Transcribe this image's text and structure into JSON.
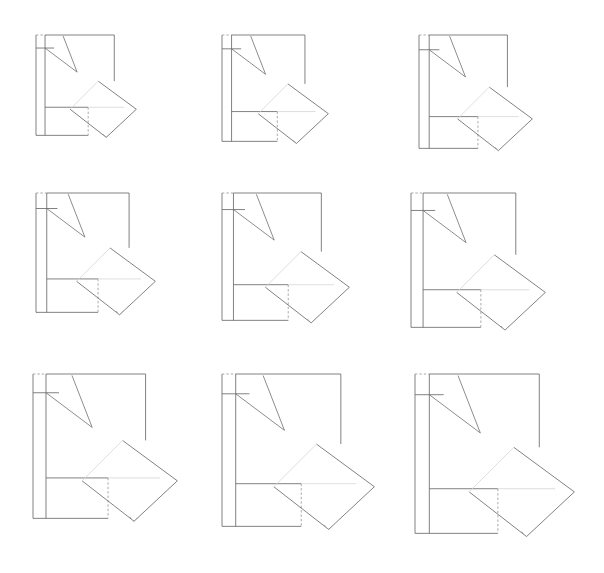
{
  "sheet": {
    "title": "Geometric Progression Diagram Grid",
    "background_color": "#ffffff",
    "width": 604,
    "height": 573,
    "rows": 3,
    "columns": 3,
    "total_figures": 9,
    "description": "Nine line-drawn plan diagrams arranged in a 3x3 grid, each a scaled-up repetition of the same construction."
  },
  "style": {
    "line_color": "#6b6b6b",
    "dashed_line_color": "#9a9a9a",
    "faint_line_color": "#d6d6d6",
    "wedge_line_color": "#707070",
    "stroke_width": 0.85
  },
  "shape_template": {
    "name": "plan-figure",
    "parts": [
      "main-rectangle",
      "left-narrow-column",
      "inner-vertical-divider",
      "upper-left-horizontal-rule",
      "lower-left-room",
      "rotated-square",
      "wedge-arrow-long",
      "wedge-arrow-short",
      "dashed-top-edge",
      "dashed-right-drop"
    ],
    "unit_box": {
      "w": 100,
      "h": 100
    }
  },
  "figures": [
    {
      "id": "figure-1",
      "row": 1,
      "column": 1,
      "label": "1",
      "origin_x": 36,
      "origin_y": 35,
      "scale": 1.0,
      "size_px": 95
    },
    {
      "id": "figure-2",
      "row": 1,
      "column": 2,
      "label": "2",
      "origin_x": 222,
      "origin_y": 35,
      "scale": 1.06,
      "size_px": 101
    },
    {
      "id": "figure-3",
      "row": 1,
      "column": 3,
      "label": "3",
      "origin_x": 419,
      "origin_y": 35,
      "scale": 1.14,
      "size_px": 108
    },
    {
      "id": "figure-4",
      "row": 2,
      "column": 1,
      "label": "4",
      "origin_x": 36,
      "origin_y": 193,
      "scale": 1.2,
      "size_px": 114
    },
    {
      "id": "figure-5",
      "row": 2,
      "column": 2,
      "label": "5",
      "origin_x": 222,
      "origin_y": 193,
      "scale": 1.28,
      "size_px": 122
    },
    {
      "id": "figure-6",
      "row": 2,
      "column": 3,
      "label": "6",
      "origin_x": 411,
      "origin_y": 193,
      "scale": 1.36,
      "size_px": 129
    },
    {
      "id": "figure-7",
      "row": 3,
      "column": 1,
      "label": "7",
      "origin_x": 33,
      "origin_y": 374,
      "scale": 1.46,
      "size_px": 139
    },
    {
      "id": "figure-8",
      "row": 3,
      "column": 2,
      "label": "8",
      "origin_x": 222,
      "origin_y": 374,
      "scale": 1.55,
      "size_px": 147
    },
    {
      "id": "figure-9",
      "row": 3,
      "column": 3,
      "label": "9",
      "origin_x": 415,
      "origin_y": 374,
      "scale": 1.62,
      "size_px": 154
    }
  ],
  "geometry": {
    "main_rect": {
      "x": 0,
      "y": 0,
      "w": 78,
      "h": 100
    },
    "left_column_x": 9,
    "upper_rule_y": 13,
    "lower_room_y": 72,
    "lower_room_right": 52,
    "rotated_square": {
      "top_x": 62,
      "top_y": 46,
      "right_x": 100,
      "right_y": 74,
      "bottom_x": 70,
      "bottom_y": 102,
      "left_x": 34,
      "left_y": 74
    },
    "wedge_long": {
      "x1": 27,
      "y1": 1,
      "x2": 41,
      "y2": 37
    },
    "wedge_short": {
      "x1": 9,
      "y1": 13,
      "x2": 41,
      "y2": 37
    }
  }
}
